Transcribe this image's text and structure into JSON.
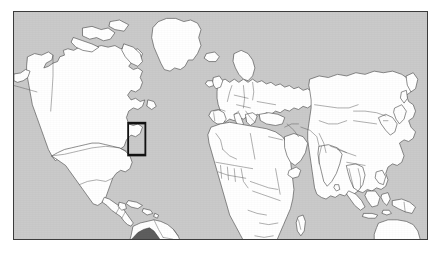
{
  "figure": {
    "kind": "world-locator-map",
    "caption": "",
    "background_color": "#ffffff",
    "frame": {
      "border_color": "#3c3c3c",
      "border_width_px": 1,
      "x_px": 13,
      "y_px": 11,
      "width_px": 415,
      "height_px": 229
    }
  },
  "map": {
    "projection": "Plate Carree (equirectangular)",
    "ocean_color": "#cacaca",
    "land_color": "#ffffff",
    "coastline_color": "#4a4a4a",
    "country_border_color": "#5a5a5a",
    "lon_range": [
      -180,
      180
    ],
    "lat_range": [
      -58,
      84
    ],
    "graticule_visible": false,
    "labels_visible": false,
    "antarctica_included": false,
    "continents": [
      "North America",
      "South America",
      "Europe",
      "Africa",
      "Asia",
      "Oceania"
    ]
  },
  "highlight": {
    "country_name": "Colombia",
    "country_fill": "#5e5e5e",
    "box_stroke_color": "#121212",
    "box_stroke_width_px": 1.6,
    "box_px": {
      "x": 128,
      "y": 143,
      "width": 24,
      "height": 27
    },
    "box_lon_lat": {
      "west": -80.5,
      "east": -65.5,
      "south": -5.5,
      "north": 14.5
    }
  },
  "chart_data": {
    "type": "map",
    "xlabel": "Longitude",
    "ylabel": "Latitude",
    "xlim": [
      -180,
      180
    ],
    "ylim": [
      -58,
      84
    ],
    "grid": false,
    "legend": "none",
    "series": [
      {
        "name": "Ocean",
        "color": "#cacaca"
      },
      {
        "name": "Land",
        "color": "#ffffff"
      },
      {
        "name": "Highlighted country",
        "color": "#5e5e5e",
        "value": "Colombia"
      },
      {
        "name": "Locator box",
        "color": "#121212"
      }
    ],
    "annotations": [
      {
        "label": "Colombia",
        "type": "rectangle",
        "west": -80.5,
        "east": -65.5,
        "south": -5.5,
        "north": 14.5
      }
    ]
  }
}
